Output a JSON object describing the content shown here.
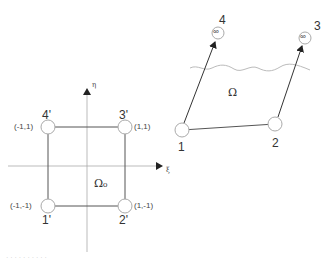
{
  "reference_element": {
    "axes": {
      "xi_label": "ξ",
      "eta_label": "η"
    },
    "domain_label": "Ω₀",
    "nodes": [
      {
        "id": "1'",
        "label": "1'",
        "coord": "(-1,-1)"
      },
      {
        "id": "2'",
        "label": "2'",
        "coord": "(1,-1)"
      },
      {
        "id": "3'",
        "label": "3'",
        "coord": "(1,1)"
      },
      {
        "id": "4'",
        "label": "4'",
        "coord": "(-1,1)"
      }
    ]
  },
  "physical_element": {
    "domain_label": "Ω",
    "nodes": [
      {
        "id": "1",
        "label": "1"
      },
      {
        "id": "2",
        "label": "2"
      },
      {
        "id": "3",
        "label": "3",
        "symbol": "∞"
      },
      {
        "id": "4",
        "label": "4",
        "symbol": "∞"
      }
    ]
  },
  "caption": "· · · · · · · · · ·",
  "colors": {
    "line": "#555555",
    "axis": "#999999",
    "node_stroke": "#aaaaaa",
    "wave": "#bbbbbb"
  }
}
